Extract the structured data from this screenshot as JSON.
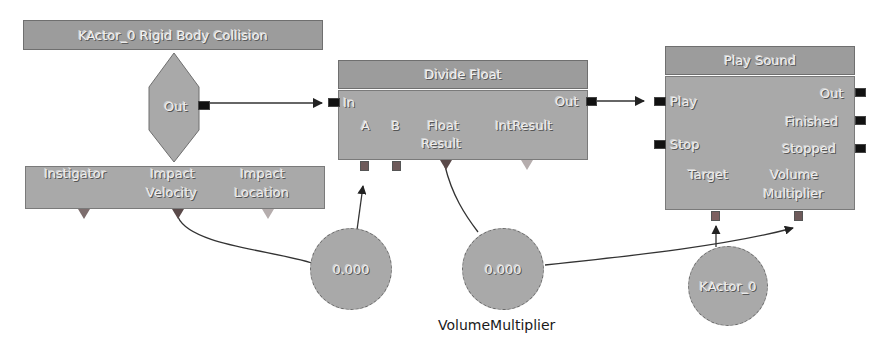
{
  "event_node": {
    "title": "KActor_0 Rigid Body Collision",
    "output": "Out",
    "variables": [
      "Instigator",
      "Impact\nVelocity",
      "Impact\nLocation"
    ],
    "variable_lines": [
      [
        "Instigator"
      ],
      [
        "Impact",
        "Velocity"
      ],
      [
        "Impact",
        "Location"
      ]
    ]
  },
  "divide_node": {
    "title": "Divide Float",
    "input": "In",
    "output": "Out",
    "vars": {
      "a": "A",
      "b": "B",
      "float_result_1": "Float",
      "float_result_2": "Result",
      "int_result": "IntResult"
    }
  },
  "play_node": {
    "title": "Play Sound",
    "inputs": {
      "play": "Play",
      "stop": "Stop"
    },
    "outputs": {
      "out": "Out",
      "finished": "Finished",
      "stopped": "Stopped"
    },
    "vars": {
      "target": "Target",
      "volume_1": "Volume",
      "volume_2": "Multiplier"
    }
  },
  "variables": {
    "float_var_1": {
      "value": "0.000"
    },
    "float_var_2": {
      "value": "0.000",
      "name": "VolumeMultiplier"
    },
    "object_var": {
      "value": "KActor_0"
    }
  },
  "colors": {
    "node_fill": "#a9a9a9",
    "title_fill": "#9c9c9c",
    "port_black": "#111111",
    "var_port": "#6e5a5a",
    "wire": "#333333",
    "background": "#ffffff"
  }
}
